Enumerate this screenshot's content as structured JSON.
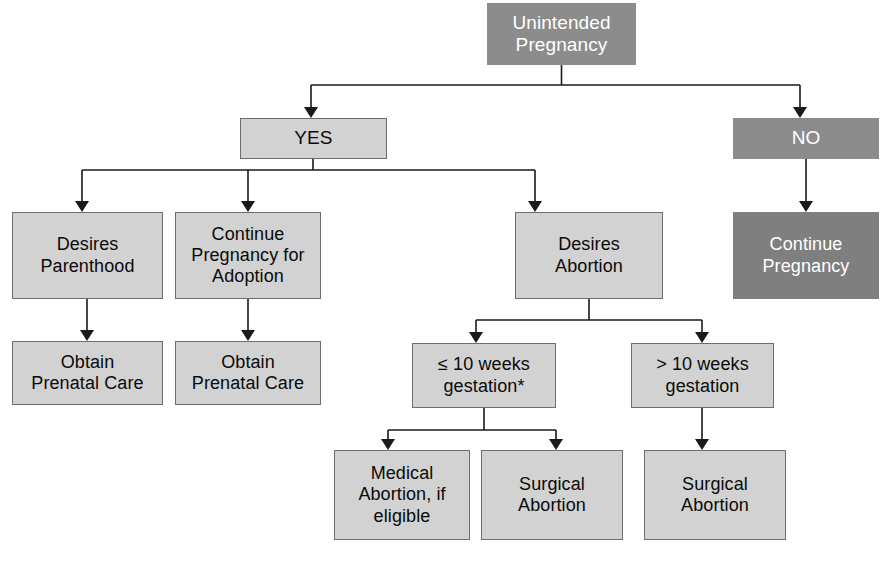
{
  "diagram": {
    "colors": {
      "light_box_fill": "#d2d2d2",
      "light_box_border": "#6e6e6e",
      "dark_box_fill": "#8c8c8c",
      "darker_box_fill": "#7f7f7f",
      "light_box_text": "#0a0a0a",
      "dark_box_text": "#ffffff",
      "connector": "#1a1a1a",
      "background": "#ffffff"
    },
    "nodes": [
      {
        "id": "unintended-pregnancy",
        "label": "Unintended\nPregnancy",
        "style": "dark",
        "x": 487,
        "y": 3,
        "w": 149,
        "h": 62,
        "font_size": 19
      },
      {
        "id": "yes",
        "label": "YES",
        "style": "light",
        "x": 240,
        "y": 118,
        "w": 147,
        "h": 41,
        "font_size": 19
      },
      {
        "id": "no",
        "label": "NO",
        "style": "dark",
        "x": 733,
        "y": 118,
        "w": 146,
        "h": 41,
        "font_size": 19
      },
      {
        "id": "desires-parenthood",
        "label": "Desires\nParenthood",
        "style": "light",
        "x": 12,
        "y": 212,
        "w": 151,
        "h": 87,
        "font_size": 18
      },
      {
        "id": "continue-pregnancy-for-adoption",
        "label": "Continue\nPregnancy for\nAdoption",
        "style": "light",
        "x": 175,
        "y": 212,
        "w": 146,
        "h": 87,
        "font_size": 18
      },
      {
        "id": "desires-abortion",
        "label": "Desires\nAbortion",
        "style": "light",
        "x": 515,
        "y": 212,
        "w": 148,
        "h": 87,
        "font_size": 18
      },
      {
        "id": "continue-pregnancy",
        "label": "Continue\nPregnancy",
        "style": "darker",
        "x": 733,
        "y": 212,
        "w": 146,
        "h": 87,
        "font_size": 18
      },
      {
        "id": "obtain-prenatal-care-left",
        "label": "Obtain\nPrenatal Care",
        "style": "light",
        "x": 12,
        "y": 341,
        "w": 151,
        "h": 64,
        "font_size": 18
      },
      {
        "id": "obtain-prenatal-care-middle",
        "label": "Obtain\nPrenatal Care",
        "style": "light",
        "x": 175,
        "y": 341,
        "w": 146,
        "h": 64,
        "font_size": 18
      },
      {
        "id": "lte-10-weeks-gestation",
        "label": "≤ 10 weeks\ngestation*",
        "style": "light",
        "x": 412,
        "y": 343,
        "w": 144,
        "h": 65,
        "font_size": 18
      },
      {
        "id": "gt-10-weeks-gestation",
        "label": "> 10 weeks\ngestation",
        "style": "light",
        "x": 631,
        "y": 343,
        "w": 143,
        "h": 65,
        "font_size": 18
      },
      {
        "id": "medical-abortion-if-eligible",
        "label": "Medical\nAbortion, if\neligible",
        "style": "light",
        "x": 334,
        "y": 450,
        "w": 136,
        "h": 90,
        "font_size": 18
      },
      {
        "id": "surgical-abortion-left",
        "label": "Surgical\nAbortion",
        "style": "light",
        "x": 481,
        "y": 450,
        "w": 142,
        "h": 90,
        "font_size": 18
      },
      {
        "id": "surgical-abortion-right",
        "label": "Surgical\nAbortion",
        "style": "light",
        "x": 644,
        "y": 450,
        "w": 142,
        "h": 90,
        "font_size": 18
      }
    ],
    "connectors": {
      "stroke": "#1a1a1a",
      "stroke_width": 1.6,
      "paths": [
        "M 561.5 65 L 561.5 85",
        "M 311 85 L 800 85",
        "M 311 85 L 311 112",
        "M 800 85 L 800 112",
        "M 313 159 L 313 170",
        "M 82 170 L 535 170",
        "M 82 170 L 82 206",
        "M 248 170 L 248 206",
        "M 535 170 L 535 206",
        "M 806 159 L 806 206",
        "M 87 299 L 87 335",
        "M 248 299 L 248 335",
        "M 589 299 L 589 320",
        "M 476 320 L 702 320",
        "M 476 320 L 476 337",
        "M 702 320 L 702 337",
        "M 484 408 L 484 430",
        "M 388 430 L 556 430",
        "M 388 430 L 388 444",
        "M 556 430 L 556 444",
        "M 702 408 L 702 444"
      ],
      "arrowheads": [
        {
          "x": 311,
          "y": 118
        },
        {
          "x": 800,
          "y": 118
        },
        {
          "x": 82,
          "y": 212
        },
        {
          "x": 248,
          "y": 212
        },
        {
          "x": 535,
          "y": 212
        },
        {
          "x": 806,
          "y": 212
        },
        {
          "x": 87,
          "y": 341
        },
        {
          "x": 248,
          "y": 341
        },
        {
          "x": 476,
          "y": 343
        },
        {
          "x": 702,
          "y": 343
        },
        {
          "x": 388,
          "y": 450
        },
        {
          "x": 556,
          "y": 450
        },
        {
          "x": 702,
          "y": 450
        }
      ]
    }
  }
}
